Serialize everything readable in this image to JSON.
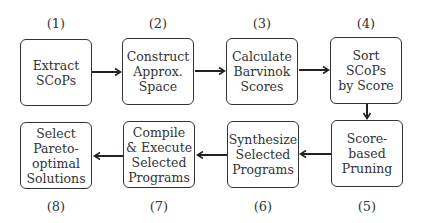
{
  "diagram": {
    "type": "flowchart",
    "steps": [
      {
        "number": "(1)",
        "label": "Extract\nSCoPs"
      },
      {
        "number": "(2)",
        "label": "Construct\nApprox.\nSpace"
      },
      {
        "number": "(3)",
        "label": "Calculate\nBarvinok\nScores"
      },
      {
        "number": "(4)",
        "label": "Sort SCoPs\nby Score"
      },
      {
        "number": "(5)",
        "label": "Score-based\nPruning"
      },
      {
        "number": "(6)",
        "label": "Synthesize\nSelected\nPrograms"
      },
      {
        "number": "(7)",
        "label": "Compile\n& Execute\nSelected\nPrograms"
      },
      {
        "number": "(8)",
        "label": "Select\nPareto-\noptimal\nSolutions"
      }
    ],
    "edges": [
      {
        "from": 1,
        "to": 2
      },
      {
        "from": 2,
        "to": 3
      },
      {
        "from": 3,
        "to": 4
      },
      {
        "from": 4,
        "to": 5
      },
      {
        "from": 5,
        "to": 6
      },
      {
        "from": 6,
        "to": 7
      },
      {
        "from": 7,
        "to": 8
      }
    ],
    "colors": {
      "stroke": "#222222",
      "text": "#333333",
      "background": "#ffffff"
    }
  }
}
